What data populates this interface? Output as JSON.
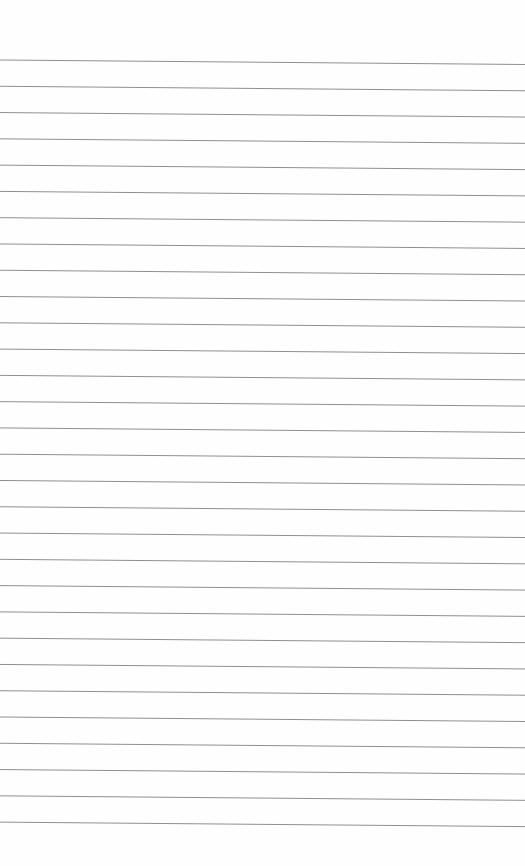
{
  "page": {
    "type": "lined-paper",
    "background": "#fefefe",
    "line_color": "#8f8f8f",
    "line_count": 30,
    "first_line_left_y": 60,
    "first_line_right_y": 64.5,
    "line_spacing": 26.28,
    "line_width": 1
  }
}
